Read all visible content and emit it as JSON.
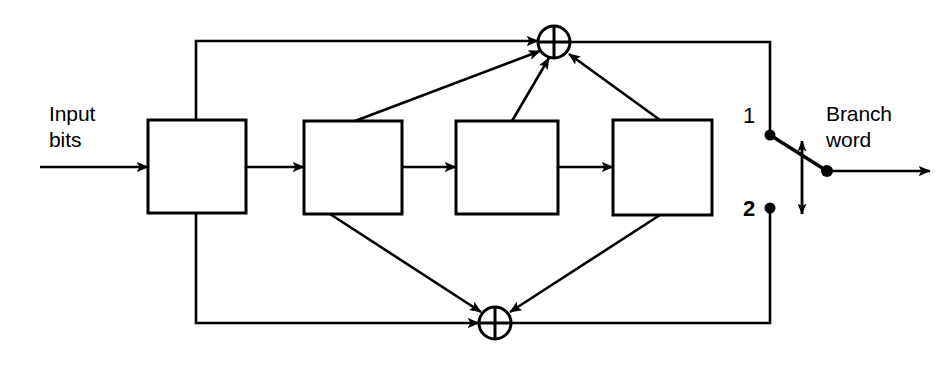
{
  "figure": {
    "type": "block-diagram",
    "background_color": "#ffffff",
    "stroke_color": "#000000"
  },
  "labels": {
    "input": "Input\nbits",
    "output": "Branch\nword",
    "terminal_1": "1",
    "terminal_2": "2"
  },
  "registers": [
    {
      "id": "stage-1",
      "x": 148,
      "y": 120,
      "w": 98,
      "h": 93
    },
    {
      "id": "stage-2",
      "x": 304,
      "y": 121,
      "w": 98,
      "h": 93
    },
    {
      "id": "stage-3",
      "x": 456,
      "y": 121,
      "w": 102,
      "h": 93
    },
    {
      "id": "stage-4",
      "x": 613,
      "y": 120,
      "w": 99,
      "h": 95
    }
  ],
  "adders": [
    {
      "id": "upper-xor",
      "cx": 554,
      "cy": 42,
      "r": 16,
      "symbol": "plus"
    },
    {
      "id": "lower-xor",
      "cx": 495,
      "cy": 323,
      "r": 16,
      "symbol": "plus"
    }
  ],
  "switch": {
    "terminal_1_dot": {
      "x": 770,
      "y": 135
    },
    "terminal_2_dot": {
      "x": 770,
      "y": 208
    },
    "pivot_dot": {
      "x": 827,
      "y": 171
    },
    "travel_arrow": {
      "x": 802,
      "y_top": 139,
      "y_bottom": 216
    }
  },
  "connections": [
    {
      "from": "input",
      "to": "stage-1",
      "kind": "arrow"
    },
    {
      "from": "stage-1",
      "to": "stage-2",
      "kind": "arrow"
    },
    {
      "from": "stage-2",
      "to": "stage-3",
      "kind": "arrow"
    },
    {
      "from": "stage-3",
      "to": "stage-4",
      "kind": "arrow"
    },
    {
      "from": "input-tap",
      "to": "upper-xor",
      "kind": "arrow"
    },
    {
      "from": "stage-2-top",
      "to": "upper-xor",
      "kind": "arrow"
    },
    {
      "from": "stage-3-top",
      "to": "upper-xor",
      "kind": "arrow"
    },
    {
      "from": "stage-4-top",
      "to": "upper-xor",
      "kind": "arrow"
    },
    {
      "from": "input-tap",
      "to": "lower-xor",
      "kind": "arrow"
    },
    {
      "from": "stage-2-bottom",
      "to": "lower-xor",
      "kind": "arrow"
    },
    {
      "from": "stage-4-bottom",
      "to": "lower-xor",
      "kind": "arrow"
    },
    {
      "from": "upper-xor",
      "to": "terminal-1",
      "kind": "line"
    },
    {
      "from": "lower-xor",
      "to": "terminal-2",
      "kind": "line"
    },
    {
      "from": "pivot",
      "to": "output",
      "kind": "arrow"
    }
  ]
}
